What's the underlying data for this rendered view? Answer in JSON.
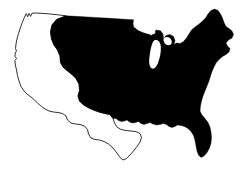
{
  "figure": {
    "title": "Map of the contiguous United States",
    "width_px": 249,
    "height_px": 170,
    "background_color": "#ffffff"
  },
  "map": {
    "subject": "contiguous-united-states",
    "projection_note": "simplified silhouette, no graticule",
    "regions": [
      {
        "id": "western-region",
        "label": "Western United States",
        "style": "outline",
        "fill_color": "#ffffff",
        "stroke_color": "#1a1a1a",
        "notes": "Pacific coast, Rocky Mountain states, Southwest and Texas shown unfilled"
      },
      {
        "id": "eastern-central-region",
        "label": "Eastern and Central United States",
        "style": "filled",
        "fill_color": "#000000",
        "stroke_color": "#000000",
        "notes": "Great Plains through the Atlantic seaboard, Gulf Coast and Florida shown solid black"
      }
    ],
    "features": [
      {
        "id": "puget-sound",
        "label": "Puget Sound notch"
      },
      {
        "id": "great-lakes",
        "label": "Great Lakes"
      },
      {
        "id": "lake-michigan",
        "label": "Lake Michigan"
      },
      {
        "id": "maine-northeast",
        "label": "Maine / Northeast protrusion"
      },
      {
        "id": "florida-peninsula",
        "label": "Florida peninsula"
      },
      {
        "id": "texas-gulf",
        "label": "Texas and Gulf coast"
      },
      {
        "id": "mexico-border",
        "label": "Southern border stair-step"
      },
      {
        "id": "california-coast",
        "label": "California coastline"
      }
    ],
    "legend": {
      "visible": false,
      "entries": [
        {
          "swatch_color": "#000000",
          "label": "Highlighted region"
        },
        {
          "swatch_color": "#ffffff",
          "label": "Unhighlighted region"
        }
      ]
    },
    "labels_visible": false,
    "title_visible": false
  }
}
